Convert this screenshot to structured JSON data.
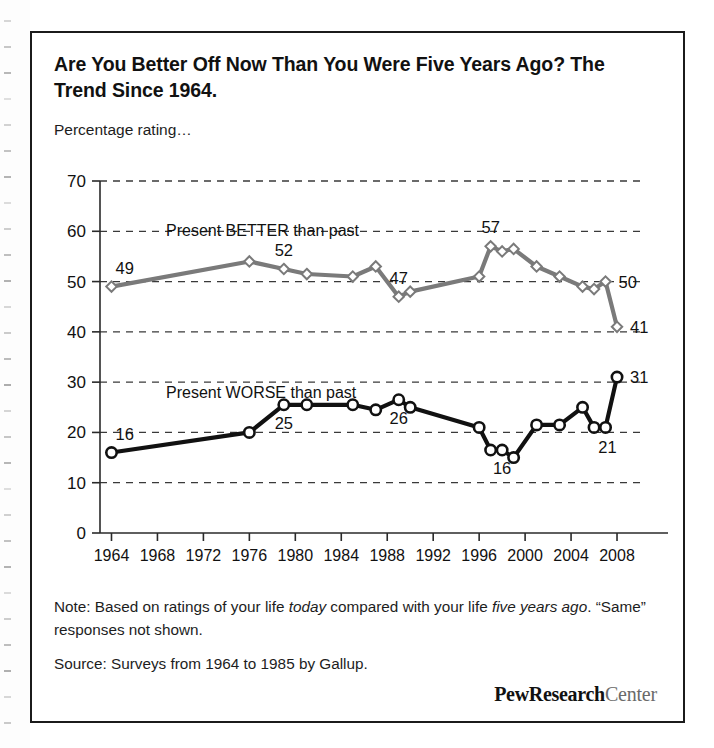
{
  "title": "Are You Better Off Now Than You Were Five Years Ago? The Trend Since 1964.",
  "subtitle": "Percentage rating…",
  "notes": {
    "note_prefix": "Note: Based on ratings of your life ",
    "note_em1": "today",
    "note_mid": " compared with your life ",
    "note_em2": "five years ago",
    "note_suffix": ". “Same” responses not shown.",
    "source": "Source: Surveys from 1964 to 1985 by Gallup."
  },
  "logo": {
    "bold": "PewResearch",
    "light": "Center"
  },
  "colors": {
    "better_line": "#7a7a7a",
    "worse_line": "#111111",
    "marker_fill": "#ffffff",
    "axis": "#2a2a2a",
    "grid": "#3a3a3a",
    "frame": "#1b1b1b"
  },
  "chart_data": {
    "type": "line",
    "title": "Are You Better Off Now Than You Were Five Years Ago? The Trend Since 1964.",
    "subtitle": "Percentage rating…",
    "xlabel": "",
    "ylabel": "",
    "xlim": [
      1963,
      2010
    ],
    "ylim": [
      0,
      70
    ],
    "ytick_step": 10,
    "yticks": [
      0,
      10,
      20,
      30,
      40,
      50,
      60,
      70
    ],
    "xticks": [
      1964,
      1968,
      1972,
      1976,
      1980,
      1984,
      1988,
      1992,
      1996,
      2000,
      2004,
      2008
    ],
    "grid": "horizontal-dashed",
    "legend_position": "inline-annotations",
    "marker_style": {
      "Present BETTER than past": "open-diamond",
      "Present WORSE than past": "open-circle"
    },
    "series": [
      {
        "name": "Present BETTER than past",
        "color": "#7a7a7a",
        "annotation": "Present BETTER than past",
        "x": [
          1964,
          1976,
          1979,
          1981,
          1985,
          1987,
          1989,
          1990,
          1996,
          1997,
          1998,
          1999,
          2001,
          2003,
          2005,
          2006,
          2007,
          2008
        ],
        "values": [
          49,
          54,
          52.5,
          51.5,
          51,
          53,
          47,
          48,
          51,
          57,
          56,
          56.5,
          53,
          51,
          49,
          48.5,
          50,
          41
        ],
        "point_labels": [
          {
            "x": 1964,
            "value": 49,
            "text": "49",
            "position": "above-left"
          },
          {
            "x": 1979,
            "value": 52.5,
            "text": "52",
            "position": "above"
          },
          {
            "x": 1989,
            "value": 47,
            "text": "47",
            "position": "above"
          },
          {
            "x": 1997,
            "value": 57,
            "text": "57",
            "position": "above"
          },
          {
            "x": 2007,
            "value": 50,
            "text": "50",
            "position": "right"
          },
          {
            "x": 2008,
            "value": 41,
            "text": "41",
            "position": "right"
          }
        ]
      },
      {
        "name": "Present WORSE than past",
        "color": "#111111",
        "annotation": "Present WORSE than past",
        "x": [
          1964,
          1976,
          1979,
          1981,
          1985,
          1987,
          1989,
          1990,
          1996,
          1997,
          1998,
          1999,
          2001,
          2003,
          2005,
          2006,
          2007,
          2008
        ],
        "values": [
          16,
          20,
          25.5,
          25.5,
          25.5,
          24.5,
          26.5,
          25,
          21,
          16.5,
          16.5,
          15,
          21.5,
          21.5,
          25,
          21,
          21,
          31
        ],
        "point_labels": [
          {
            "x": 1964,
            "value": 16,
            "text": "16",
            "position": "above-left"
          },
          {
            "x": 1979,
            "value": 25.5,
            "text": "25",
            "position": "below"
          },
          {
            "x": 1989,
            "value": 26.5,
            "text": "26",
            "position": "below"
          },
          {
            "x": 1998,
            "value": 16.5,
            "text": "16",
            "position": "below"
          },
          {
            "x": 2007,
            "value": 21,
            "text": "21",
            "position": "below-right"
          },
          {
            "x": 2008,
            "value": 31,
            "text": "31",
            "position": "right"
          }
        ]
      }
    ]
  }
}
